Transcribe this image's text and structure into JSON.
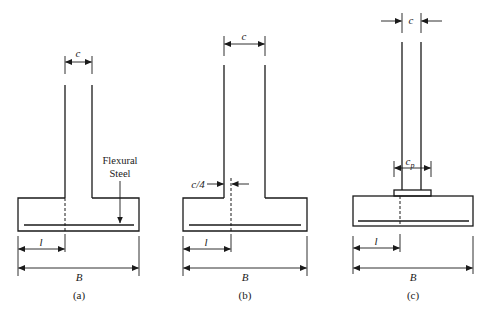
{
  "figure": {
    "panels": [
      {
        "id": "a",
        "caption": "(a)",
        "column_width_label": "c",
        "lever_arm_label": "l",
        "footing_width_label": "B",
        "annotation": {
          "line1": "Flexural",
          "line2": "Steel"
        }
      },
      {
        "id": "b",
        "caption": "(b)",
        "column_width_label": "c",
        "offset_label": "c/4",
        "lever_arm_label": "l",
        "footing_width_label": "B"
      },
      {
        "id": "c",
        "caption": "(c)",
        "column_width_label": "c",
        "base_plate_label": "c",
        "base_plate_subscript": "p",
        "lever_arm_label": "l",
        "footing_width_label": "B"
      }
    ]
  },
  "colors": {
    "line": "#1a1a1a",
    "background": "#ffffff"
  }
}
